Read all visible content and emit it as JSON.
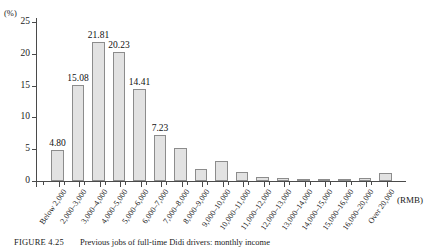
{
  "figure": {
    "caption_label": "FIGURE 4.25",
    "caption_text": "Previous jobs of full-time Didi drivers: monthly income"
  },
  "axes": {
    "y_unit_label": "(%)",
    "x_unit_label": "(RMB)"
  },
  "chart_data": {
    "type": "bar",
    "title": "Previous jobs of full-time Didi drivers: monthly income",
    "xlabel": "(RMB)",
    "ylabel": "(%)",
    "ylim": [
      0,
      25
    ],
    "yticks": [
      0,
      5,
      10,
      15,
      20,
      25
    ],
    "grid": false,
    "legend": "none",
    "categories": [
      "Below 2,000",
      "2,000–3,000",
      "3,000–4,000",
      "4,000–5,000",
      "5,000–6,000",
      "6,000–7,000",
      "7,000–8,000",
      "8,000–9,000",
      "9,000–10,000",
      "10,000–11,000",
      "11,000–12,000",
      "12,000–13,000",
      "13,000–14,000",
      "14,000–15,000",
      "15,000–16,000",
      "16,000–20,000",
      "Over 20,000"
    ],
    "values": [
      4.8,
      15.08,
      21.81,
      20.23,
      14.41,
      7.23,
      5.2,
      1.95,
      3.15,
      1.45,
      0.65,
      0.4,
      0.2,
      0.35,
      0.1,
      0.5,
      1.3
    ],
    "data_labels": [
      "4.80",
      "15.08",
      "21.81",
      "20.23",
      "14.41",
      "7.23",
      "",
      "",
      "",
      "",
      "",
      "",
      "",
      "",
      "",
      "",
      ""
    ],
    "bar_fill_color": "#e2e2e2",
    "bar_edge_color": "#8c8c8c"
  }
}
